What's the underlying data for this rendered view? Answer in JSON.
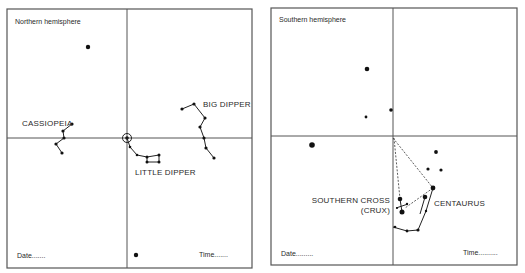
{
  "panels": [
    {
      "id": "northern",
      "title": "Northern hemisphere",
      "date_label": "Date.......",
      "time_label": "Time.......",
      "constellations": [
        {
          "name": "CASSIOPEIA"
        },
        {
          "name": "BIG DIPPER"
        },
        {
          "name": "LITTLE DIPPER"
        }
      ]
    },
    {
      "id": "southern",
      "title": "Southern hemisphere",
      "date_label": "Date.........",
      "time_label": "Time..........",
      "constellations": [
        {
          "name": "SOUTHERN CROSS",
          "alt_name": "(CRUX)"
        },
        {
          "name": "CENTAURUS"
        }
      ]
    }
  ],
  "colors": {
    "line": "#2a2a2a",
    "frame": "#555555",
    "background": "#ffffff"
  }
}
